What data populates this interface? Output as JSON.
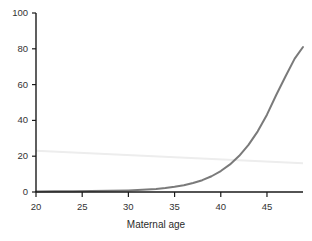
{
  "chart_data": {
    "type": "line",
    "title": "",
    "subtitle": "",
    "xlabel": "Maternal age",
    "ylabel": "",
    "xlim": [
      20,
      48.9
    ],
    "ylim": [
      0,
      100
    ],
    "grid": false,
    "legend": null,
    "xticks": [
      20,
      25,
      30,
      35,
      40,
      45
    ],
    "xtick_labels": [
      "20",
      "25",
      "30",
      "35",
      "40",
      "45"
    ],
    "yticks": [
      0,
      20,
      40,
      60,
      80,
      100
    ],
    "ytick_labels": [
      "0",
      "20",
      "40",
      "60",
      "80",
      "100"
    ],
    "series": [
      {
        "name": "risk-curve",
        "color": "#7a7a7a",
        "width": 2.0,
        "x": [
          20,
          22,
          24,
          26,
          28,
          30,
          31,
          32,
          33,
          34,
          35,
          36,
          37,
          38,
          39,
          40,
          41,
          42,
          43,
          44,
          45,
          46,
          47,
          48,
          48.9
        ],
        "values": [
          0.3,
          0.35,
          0.4,
          0.5,
          0.65,
          0.9,
          1.1,
          1.35,
          1.7,
          2.2,
          2.9,
          3.8,
          5.0,
          6.6,
          8.8,
          11.7,
          15.4,
          20.2,
          26.3,
          33.9,
          43.2,
          54.2,
          64.5,
          74.5,
          81.0
        ]
      },
      {
        "name": "reference-line",
        "color": "#ededed",
        "width": 2.0,
        "x": [
          20,
          48.9
        ],
        "values": [
          23.0,
          16.0
        ]
      }
    ],
    "annotations": []
  },
  "axes": {
    "axis_color": "#1a1a1a",
    "tick_color": "#1a1a1a",
    "background": "#ffffff"
  }
}
